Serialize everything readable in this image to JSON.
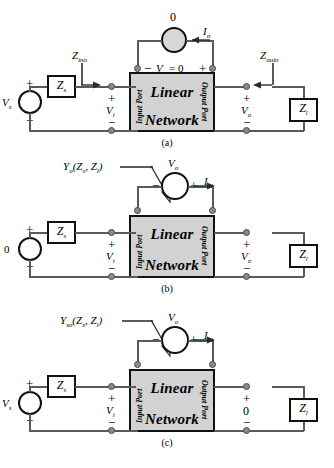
{
  "figure": {
    "network_box": {
      "line1": "Linear",
      "line2": "Network",
      "input_port": "Input Port",
      "output_port": "Output Port",
      "fill_color": "#d2d2d2"
    },
    "panels": [
      {
        "id": "a",
        "caption": "(a)",
        "source_left": {
          "value": "V",
          "sub": "s",
          "plus": "+",
          "minus": "−"
        },
        "series_impedance": {
          "value": "Z",
          "sub": "s"
        },
        "input_voltage": {
          "value": "V",
          "sub": "i",
          "plus": "+",
          "minus": "−"
        },
        "input_impedance_label": {
          "value": "Z",
          "sub": "ino"
        },
        "top_source": {
          "value": "0"
        },
        "top_current": {
          "value": "I",
          "sub": "o"
        },
        "top_port_label": {
          "minus": "−",
          "text": "V",
          "sub": "o",
          "eq": "= 0",
          "plus": "+"
        },
        "output_voltage": {
          "value": "V",
          "sub": "o",
          "plus": "+",
          "minus": "−"
        },
        "output_impedance_label": {
          "value": "Z",
          "sub": "outo"
        },
        "load_impedance": {
          "value": "Z",
          "sub": "l"
        }
      },
      {
        "id": "b",
        "caption": "(b)",
        "source_left": {
          "value": "0",
          "plus": "+",
          "minus": "−"
        },
        "series_impedance": {
          "value": "Z",
          "sub": "s"
        },
        "input_voltage": {
          "value": "V",
          "sub": "i",
          "plus": "+",
          "minus": "−"
        },
        "admittance_label": {
          "value": "Y",
          "sub": "o",
          "args": "(Z",
          "args_sub1": "s",
          "args_mid": ", Z",
          "args_sub2": "l",
          "args_end": ")"
        },
        "top_source": {
          "value": "V",
          "sub": "o",
          "plus": "+",
          "minus": "−"
        },
        "top_current": {
          "value": "I",
          "sub": "o′"
        },
        "output_voltage": {
          "value": "V",
          "sub": "o",
          "plus": "+",
          "minus": "−"
        },
        "load_impedance": {
          "value": "Z",
          "sub": "l"
        }
      },
      {
        "id": "c",
        "caption": "(c)",
        "source_left": {
          "value": "V",
          "sub": "s",
          "plus": "+",
          "minus": "−"
        },
        "series_impedance": {
          "value": "Z",
          "sub": "s"
        },
        "input_voltage": {
          "value": "V",
          "sub": "i",
          "plus": "+",
          "minus": "−"
        },
        "admittance_label": {
          "value": "Y",
          "sub": "so",
          "args": "(Z",
          "args_sub1": "s",
          "args_mid": ", Z",
          "args_sub2": "l",
          "args_end": ")"
        },
        "top_source": {
          "value": "V",
          "sub": "o",
          "plus": "+",
          "minus": "−"
        },
        "top_current": {
          "value": "I",
          "sub": "o′"
        },
        "output_voltage": {
          "value": "0",
          "plus": "+",
          "minus": "−"
        },
        "load_impedance": {
          "value": "Z",
          "sub": "l"
        }
      }
    ]
  }
}
